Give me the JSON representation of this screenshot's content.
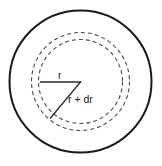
{
  "figure": {
    "name": "concentric-shell-diagram",
    "background_color": "#ffffff",
    "canvas": {
      "width": 162,
      "height": 166
    },
    "center": {
      "x": 80.5,
      "y": 81.5
    },
    "outer_circle": {
      "name": "outer-solid-circle",
      "radius": 71,
      "style": "solid",
      "color": "#1a1a1a",
      "stroke_width": 2
    },
    "dashed_circles": [
      {
        "name": "inner-dashed-circle",
        "radius": 42,
        "style": "dashed",
        "color": "#4a4a4a",
        "dash_pattern": "4 3",
        "represents": "r"
      },
      {
        "name": "outer-dashed-circle",
        "radius": 49,
        "style": "dashed",
        "color": "#4a4a4a",
        "dash_pattern": "4 3",
        "represents": "r + dr"
      }
    ],
    "radius_lines": [
      {
        "name": "radius-line-r",
        "from": {
          "x": 40.5,
          "y": 82
        },
        "to": {
          "x": 80.5,
          "y": 82
        },
        "color": "#2b2b2b",
        "label_ref": "r"
      },
      {
        "name": "radius-line-r-plus-dr",
        "from": {
          "x": 80.5,
          "y": 82
        },
        "to": {
          "x": 50.5,
          "y": 118
        },
        "color": "#2b2b2b",
        "label_ref": "r + dr"
      }
    ],
    "labels": {
      "r": "r",
      "r_plus_dr": "r + dr"
    },
    "label_positions": {
      "r": {
        "x": 58,
        "y": 79
      },
      "r_plus_dr": {
        "x": 68,
        "y": 103
      }
    }
  }
}
